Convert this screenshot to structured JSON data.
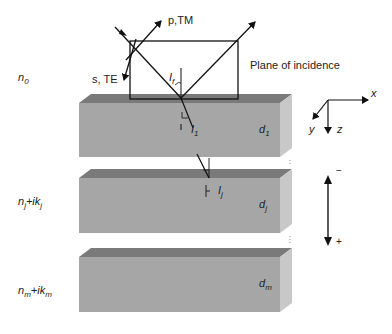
{
  "diagram": {
    "media_labels": {
      "ambient": {
        "base": "n",
        "sub": "0"
      },
      "layer_j": {
        "base": "n",
        "sub": "j",
        "suffix": "+ik",
        "suffix_sub": "j"
      },
      "substrate": {
        "base": "n",
        "sub": "m",
        "suffix": "+ik",
        "suffix_sub": "m"
      }
    },
    "layers": [
      {
        "id": "layer-1",
        "thickness_label": {
          "base": "d",
          "sub": "1"
        }
      },
      {
        "id": "layer-j",
        "thickness_label": {
          "base": "d",
          "sub": "j"
        }
      },
      {
        "id": "layer-m",
        "thickness_label": {
          "base": "d",
          "sub": "m"
        }
      }
    ],
    "polarization": {
      "p": "p,TM",
      "s": "s, TE"
    },
    "plane_label": "Plane of incidence",
    "angles": {
      "incident": {
        "base": "I",
        "sub": "f"
      },
      "layer_1": {
        "base": "I",
        "sub": "1"
      },
      "layer_j": {
        "base": "I",
        "sub": "j"
      }
    },
    "axes": {
      "x": "x",
      "y": "y",
      "z": "z"
    },
    "direction": {
      "minus": "−",
      "plus": "+"
    },
    "colors": {
      "front_face": "#a6a6a6",
      "top_face": "#7a7a7a",
      "side_face": "#c8c8c8",
      "line": "#111111"
    }
  }
}
